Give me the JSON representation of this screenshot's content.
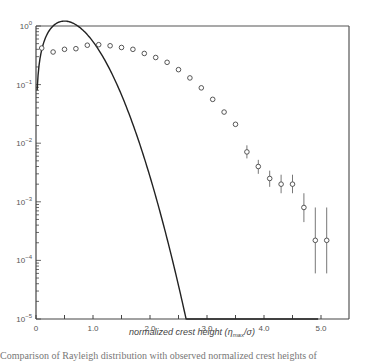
{
  "chart_data": {
    "type": "scatter",
    "title": "",
    "xlabel": "normalized crest height (η_max/σ)",
    "xlabel_parts": {
      "prefix": "normalized crest height (",
      "eta": "η",
      "sub": "max",
      "suffix": "/σ)"
    },
    "ylabel": "",
    "xlim": [
      0,
      5.5
    ],
    "ylim": [
      1e-05,
      1
    ],
    "yscale": "log",
    "grid": false,
    "x_ticks": [
      0,
      0.5,
      1.0,
      1.5,
      2.0,
      2.5,
      3.0,
      3.5,
      4.0,
      4.5,
      5.0
    ],
    "x_tick_labels": [
      {
        "value": 0,
        "label": "0"
      },
      {
        "value": 1.0,
        "label": "1.0"
      },
      {
        "value": 2.0,
        "label": "2.0"
      },
      {
        "value": 3.0,
        "label": "3.0"
      },
      {
        "value": 4.0,
        "label": "4.0"
      },
      {
        "value": 5.0,
        "label": "5.0"
      }
    ],
    "y_tick_labels": [
      {
        "exp": 0,
        "label": "10",
        "sup": "0"
      },
      {
        "exp": -1,
        "label": "10",
        "sup": "-1"
      },
      {
        "exp": -2,
        "label": "10",
        "sup": "-2"
      },
      {
        "exp": -3,
        "label": "10",
        "sup": "-3"
      },
      {
        "exp": -4,
        "label": "10",
        "sup": "-4"
      },
      {
        "exp": -5,
        "label": "10",
        "sup": "-5"
      }
    ],
    "series": [
      {
        "name": "observed",
        "style": "open-circle-markers",
        "x": [
          0.1,
          0.3,
          0.5,
          0.7,
          0.9,
          1.1,
          1.3,
          1.5,
          1.7,
          1.9,
          2.1,
          2.3,
          2.5,
          2.7,
          2.9,
          3.1,
          3.3,
          3.5,
          3.7,
          3.9,
          4.1,
          4.3,
          4.5,
          4.7,
          4.9,
          5.1
        ],
        "y": [
          0.42,
          0.36,
          0.4,
          0.41,
          0.47,
          0.48,
          0.46,
          0.43,
          0.4,
          0.34,
          0.29,
          0.24,
          0.18,
          0.13,
          0.088,
          0.056,
          0.034,
          0.021,
          0.0071,
          0.004,
          0.0025,
          0.002,
          0.002,
          0.0008,
          0.00022,
          0.00022
        ],
        "error_bars": [
          {
            "x": 3.7,
            "lo": 0.0055,
            "hi": 0.0092
          },
          {
            "x": 3.9,
            "lo": 0.003,
            "hi": 0.0052
          },
          {
            "x": 4.1,
            "lo": 0.0018,
            "hi": 0.0034
          },
          {
            "x": 4.3,
            "lo": 0.0014,
            "hi": 0.0029
          },
          {
            "x": 4.5,
            "lo": 0.0014,
            "hi": 0.0029
          },
          {
            "x": 4.7,
            "lo": 0.00045,
            "hi": 0.0014
          },
          {
            "x": 4.9,
            "lo": 6e-05,
            "hi": 0.0008
          },
          {
            "x": 5.1,
            "lo": 6e-05,
            "hi": 0.0008
          }
        ]
      },
      {
        "name": "Rayleigh distribution",
        "style": "solid-line",
        "formula": "p(x) = 4x·exp(-2x²)",
        "x_range": [
          0.02,
          4.95
        ]
      }
    ]
  },
  "caption": {
    "text": "Comparison of Rayleigh distribution with observed normalized crest heights of"
  }
}
